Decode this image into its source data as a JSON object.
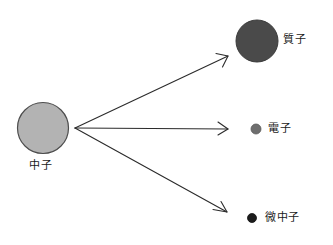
{
  "diagram": {
    "background_color": "#ffffff",
    "canvas": {
      "width": 333,
      "height": 245
    },
    "stroke_color": "#2b2b2b",
    "text_color": "#1a1a1a",
    "particles": {
      "neutron": {
        "label": "中子",
        "icon": "large-light-gray-circle",
        "fill_color": "#b3b3b3",
        "stroke_color": "#4d4d4d",
        "cx": 43,
        "cy": 128,
        "r": 25.5
      },
      "proton": {
        "label": "質子",
        "icon": "large-dark-gray-circle",
        "fill_color": "#4a4a4a",
        "stroke_color": "#3a3a3a",
        "cx": 257,
        "cy": 41,
        "r": 21
      },
      "electron": {
        "label": "電子",
        "icon": "small-gray-circle",
        "fill_color": "#6e6e6e",
        "stroke_color": "#5a5a5a",
        "cx": 256,
        "cy": 129,
        "r": 5
      },
      "neutrino": {
        "label": "微中子",
        "icon": "small-black-circle",
        "fill_color": "#1c1c1c",
        "stroke_color": "#121212",
        "cx": 252,
        "cy": 218,
        "r": 4.5
      }
    },
    "arrows": {
      "origin": {
        "x": 75,
        "y": 128
      },
      "items": [
        {
          "name": "arrow-to-proton",
          "x1": 75,
          "y1": 128,
          "x2": 228,
          "y2": 56
        },
        {
          "name": "arrow-to-electron",
          "x1": 75,
          "y1": 128,
          "x2": 228,
          "y2": 129
        },
        {
          "name": "arrow-to-neutrino",
          "x1": 75,
          "y1": 128,
          "x2": 227,
          "y2": 212
        }
      ]
    }
  }
}
